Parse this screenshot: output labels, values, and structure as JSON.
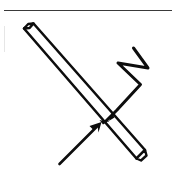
{
  "figure": {
    "background_color": "#ffffff",
    "ink_color": "#0d0d0d",
    "rule_color": "#3a3a3a",
    "elements": {
      "top_rule": {
        "name": "horizontal rule",
        "label": ""
      },
      "tube": {
        "name": "tube",
        "label": "",
        "open_end": "upper-left",
        "closed_end": "lower-right"
      },
      "tube_open_end": {
        "name": "beveled open end",
        "label": ""
      },
      "tube_closed_end": {
        "name": "angled closed tip",
        "label": ""
      },
      "zigzag_arrow": {
        "name": "zigzag arrow",
        "label": "",
        "direction": "from upper right to tube"
      },
      "straight_arrow": {
        "name": "straight arrow",
        "label": "",
        "direction": "from lower left to tube"
      },
      "convergence_point": {
        "name": "arrow convergence point",
        "label": ""
      }
    }
  }
}
